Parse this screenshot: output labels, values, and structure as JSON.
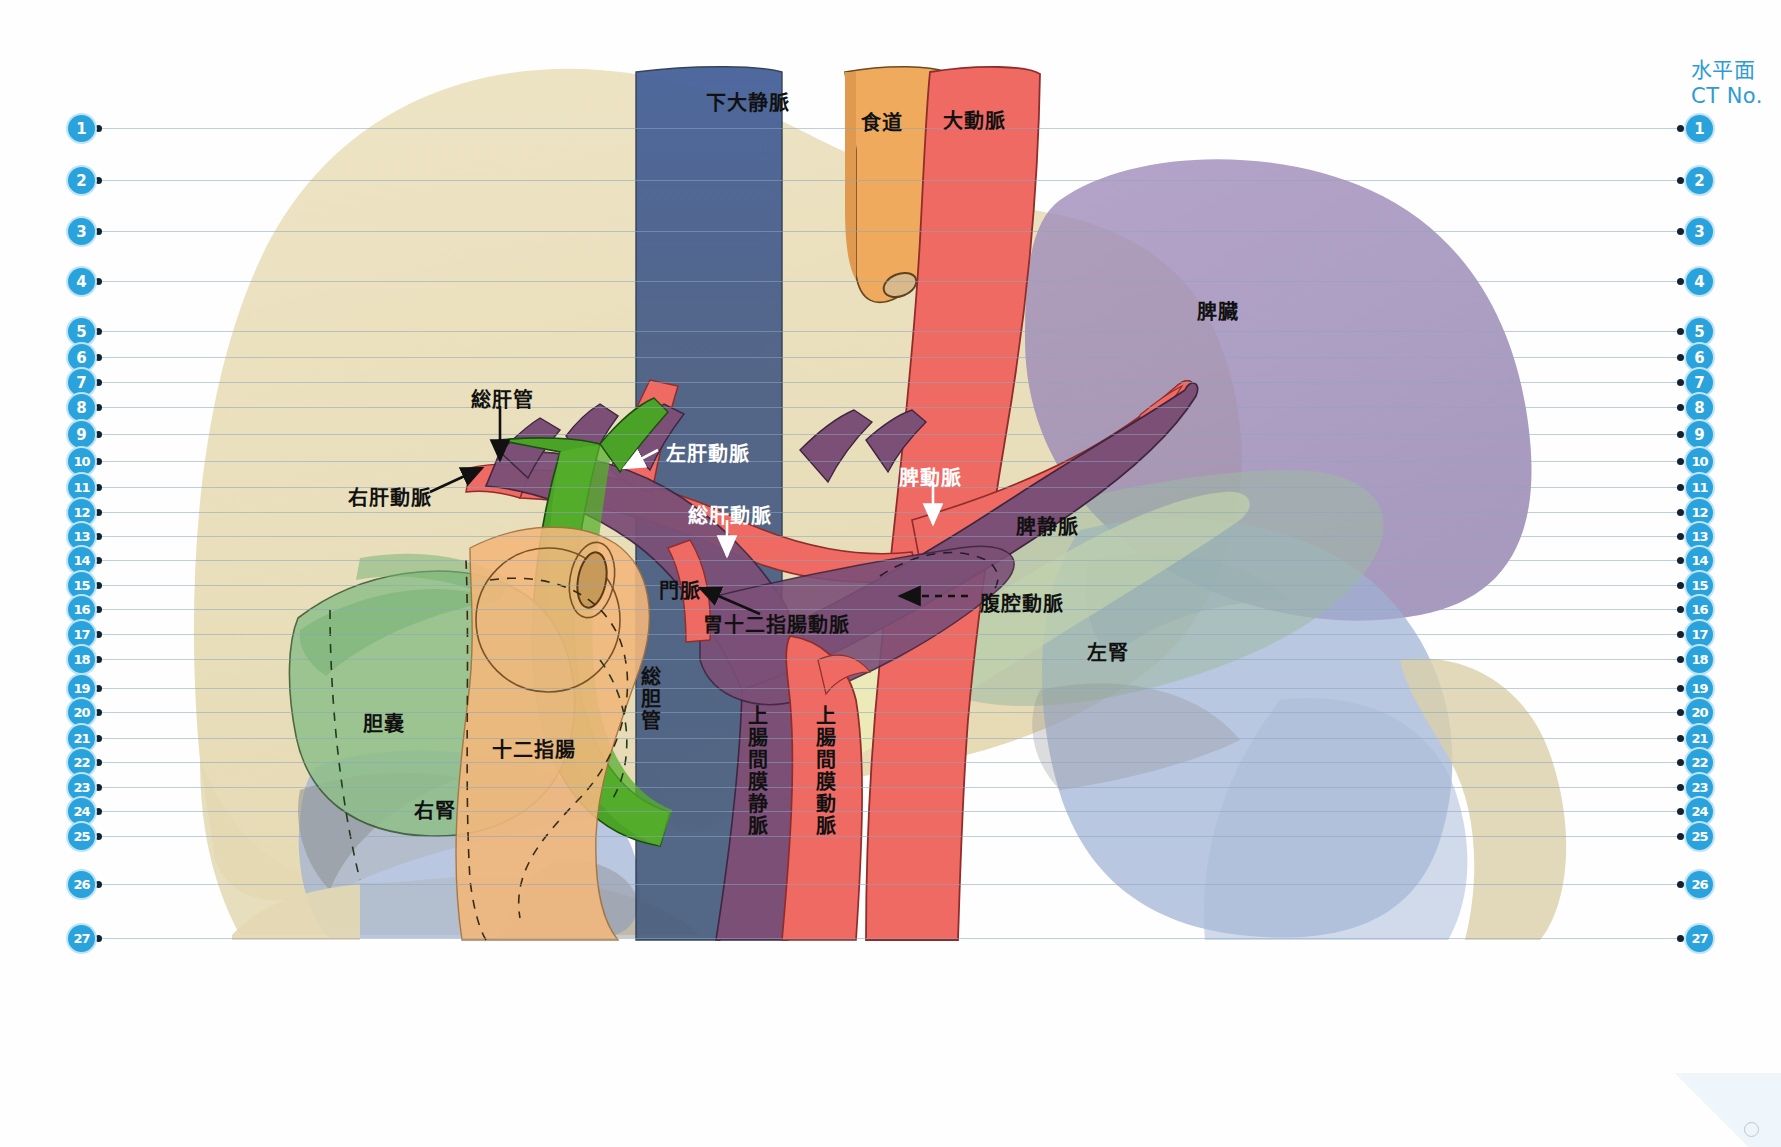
{
  "header": {
    "title": "水平面\nCT No."
  },
  "ct_scale": {
    "numbers": [
      1,
      2,
      3,
      4,
      5,
      6,
      7,
      8,
      9,
      10,
      11,
      12,
      13,
      14,
      15,
      16,
      17,
      18,
      19,
      20,
      21,
      22,
      23,
      24,
      25,
      26,
      27
    ],
    "y_positions": [
      128,
      180,
      231,
      281,
      331,
      357,
      382,
      407,
      434,
      461,
      487,
      512,
      536,
      560,
      585,
      609,
      634,
      659,
      688,
      712,
      738,
      762,
      787,
      811,
      836,
      884,
      938
    ],
    "left_x": 68,
    "right_x": 1686,
    "line_color": "#8aa6bd",
    "marker_color": "#2aa3dd"
  },
  "labels": [
    {
      "name": "inferior-vena-cava",
      "text": "下大静脈",
      "x": 706,
      "y": 87,
      "color": "dark",
      "orient": "h"
    },
    {
      "name": "esophagus",
      "text": "食道",
      "x": 861,
      "y": 107,
      "color": "dark",
      "orient": "h"
    },
    {
      "name": "aorta",
      "text": "大動脈",
      "x": 943,
      "y": 105,
      "color": "dark",
      "orient": "h"
    },
    {
      "name": "spleen",
      "text": "脾臓",
      "x": 1197,
      "y": 296,
      "color": "dark",
      "orient": "h"
    },
    {
      "name": "common-hepatic-duct",
      "text": "総肝管",
      "x": 471,
      "y": 384,
      "color": "dark",
      "orient": "h"
    },
    {
      "name": "left-hepatic-artery",
      "text": "左肝動脈",
      "x": 666,
      "y": 438,
      "color": "white",
      "orient": "h"
    },
    {
      "name": "right-hepatic-artery",
      "text": "右肝動脈",
      "x": 348,
      "y": 482,
      "color": "dark",
      "orient": "h"
    },
    {
      "name": "common-hepatic-artery",
      "text": "総肝動脈",
      "x": 688,
      "y": 500,
      "color": "white",
      "orient": "h"
    },
    {
      "name": "splenic-artery",
      "text": "脾動脈",
      "x": 899,
      "y": 462,
      "color": "white",
      "orient": "h"
    },
    {
      "name": "splenic-vein",
      "text": "脾静脈",
      "x": 1016,
      "y": 511,
      "color": "dark",
      "orient": "h"
    },
    {
      "name": "portal-vein",
      "text": "門脈",
      "x": 659,
      "y": 575,
      "color": "dark",
      "orient": "h"
    },
    {
      "name": "celiac-artery",
      "text": "腹腔動脈",
      "x": 980,
      "y": 588,
      "color": "dark",
      "orient": "h"
    },
    {
      "name": "gastroduodenal-artery",
      "text": "胃十二指腸動脈",
      "x": 703,
      "y": 609,
      "color": "dark",
      "orient": "h"
    },
    {
      "name": "left-kidney",
      "text": "左腎",
      "x": 1087,
      "y": 637,
      "color": "dark",
      "orient": "h"
    },
    {
      "name": "gallbladder",
      "text": "胆嚢",
      "x": 363,
      "y": 708,
      "color": "dark",
      "orient": "h"
    },
    {
      "name": "duodenum",
      "text": "十二指腸",
      "x": 492,
      "y": 734,
      "color": "dark",
      "orient": "h"
    },
    {
      "name": "right-kidney",
      "text": "右腎",
      "x": 414,
      "y": 795,
      "color": "dark",
      "orient": "h"
    },
    {
      "name": "common-bile-duct",
      "text": "総胆管",
      "x": 635,
      "y": 666,
      "color": "dark",
      "orient": "v"
    },
    {
      "name": "superior-mesenteric-vein",
      "text": "上腸間膜静脈",
      "x": 742,
      "y": 705,
      "color": "dark",
      "orient": "v"
    },
    {
      "name": "superior-mesenteric-artery",
      "text": "上腸間膜動脈",
      "x": 810,
      "y": 705,
      "color": "dark",
      "orient": "v"
    }
  ],
  "colors": {
    "liver": "#e7dcb8",
    "ivc": "#4a6189",
    "aorta": "#ef6a63",
    "esophagus": "#efaa5e",
    "spleen": "#9a86b5",
    "portal_vein": "#7c4f77",
    "bile_duct": "#4aa226",
    "gallbladder": "#8fc08a",
    "duodenum": "#f2b87c",
    "kidney": "#9aafd0",
    "pancreas": "#eef0b8",
    "celiac_green": "#9db9a3",
    "accent": "#2aa3dd",
    "ruler_line": "#8aa6bd"
  }
}
